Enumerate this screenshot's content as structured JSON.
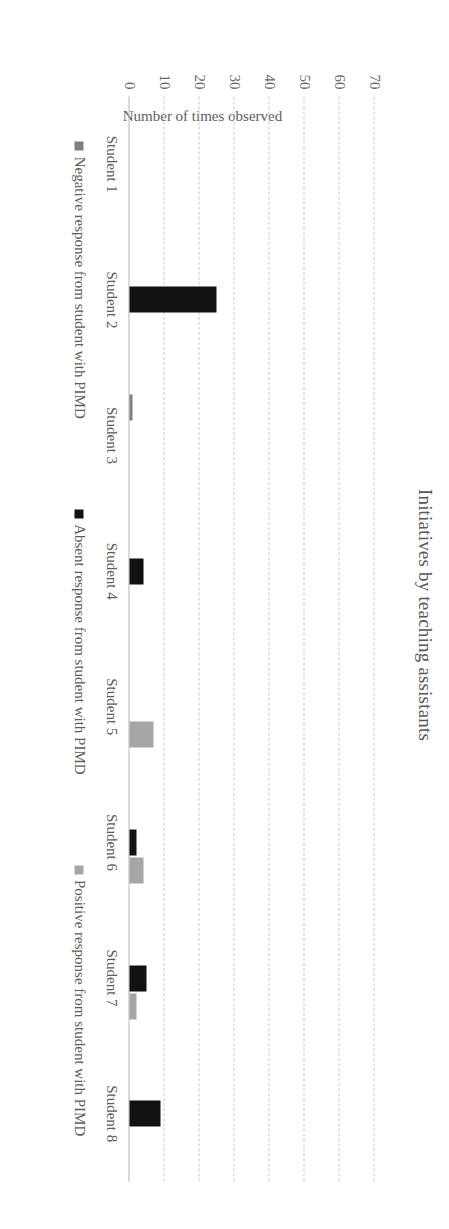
{
  "chart_data": {
    "type": "bar",
    "title": "Initiatives by teaching assistants",
    "xlabel": "",
    "ylabel": "Number of times observed",
    "categories": [
      "Student 1",
      "Student 2",
      "Student 3",
      "Student 4",
      "Student 5",
      "Student 6",
      "Student 7",
      "Student 8"
    ],
    "series": [
      {
        "name": "Negative response from student with PIMD",
        "color": "#7f7f7f",
        "values": [
          0,
          0,
          1,
          0,
          0,
          0,
          0,
          0
        ]
      },
      {
        "name": "Absent response from student with PIMD",
        "color": "#111111",
        "values": [
          0,
          25,
          0,
          4,
          0,
          2,
          5,
          9
        ]
      },
      {
        "name": "Positive response from student with PIMD",
        "color": "#a6a6a6",
        "values": [
          0,
          0,
          0,
          0,
          7,
          4,
          2,
          0
        ]
      }
    ],
    "yticks": [
      0,
      10,
      20,
      30,
      40,
      50,
      60,
      70
    ],
    "ylim": [
      0,
      75
    ],
    "grid": true,
    "legend_position": "bottom"
  },
  "legend": {
    "items": [
      {
        "label": "Negative response from student with PIMD",
        "swatch": "negative"
      },
      {
        "label": "Absent response from student with PIMD",
        "swatch": "absent"
      },
      {
        "label": "Positive response from student with PIMD",
        "swatch": "positive"
      }
    ]
  }
}
